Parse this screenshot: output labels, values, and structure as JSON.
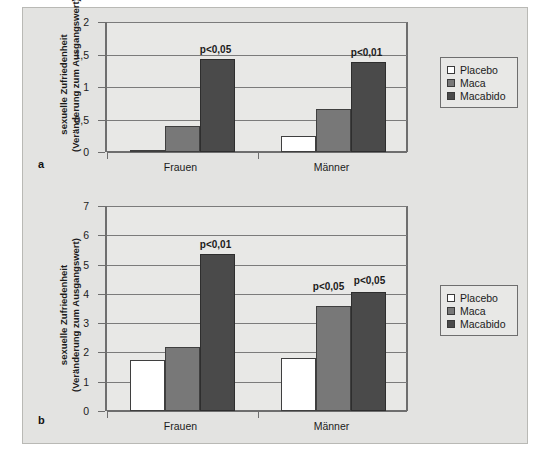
{
  "figure": {
    "background_color": "#e3e3e1",
    "panel_letters": {
      "top": "a",
      "bottom": "b"
    }
  },
  "legend": {
    "items": [
      {
        "label": "Placebo",
        "color": "#ffffff"
      },
      {
        "label": "Maca",
        "color": "#787878"
      },
      {
        "label": "Macabido",
        "color": "#4a4a4a"
      }
    ]
  },
  "axis_title": {
    "line1": "sexuelle Zufriedenheit",
    "line2": "(Veränderung zum Ausgangswert)"
  },
  "chart_data": [
    {
      "id": "a",
      "type": "bar",
      "title": "",
      "xlabel": "",
      "ylabel": "sexuelle Zufriedenheit (Veränderung zum Ausgangswert)",
      "categories": [
        "Frauen",
        "Männer"
      ],
      "ylim": [
        0,
        2
      ],
      "yticks": [
        "0",
        "0,5",
        "1",
        "1,5",
        "2"
      ],
      "ytick_values": [
        0,
        0.5,
        1,
        1.5,
        2
      ],
      "grid": true,
      "legend_position": "right",
      "series": [
        {
          "name": "Placebo",
          "color": "#ffffff",
          "values": [
            0.01,
            0.24
          ]
        },
        {
          "name": "Maca",
          "color": "#787878",
          "values": [
            0.4,
            0.66
          ]
        },
        {
          "name": "Macabido",
          "color": "#4a4a4a",
          "values": [
            1.43,
            1.39
          ]
        }
      ],
      "annotations": [
        {
          "text": "p<0,05",
          "category": "Frauen",
          "series": "Macabido"
        },
        {
          "text": "p<0,01",
          "category": "Männer",
          "series": "Macabido"
        }
      ]
    },
    {
      "id": "b",
      "type": "bar",
      "title": "",
      "xlabel": "",
      "ylabel": "sexuelle Zufriedenheit (Veränderung zum Ausgangswert)",
      "categories": [
        "Frauen",
        "Männer"
      ],
      "ylim": [
        0,
        7
      ],
      "yticks": [
        "0",
        "1",
        "2",
        "3",
        "4",
        "5",
        "6",
        "7"
      ],
      "ytick_values": [
        0,
        1,
        2,
        3,
        4,
        5,
        6,
        7
      ],
      "grid": true,
      "legend_position": "right",
      "series": [
        {
          "name": "Placebo",
          "color": "#ffffff",
          "values": [
            1.75,
            1.8
          ]
        },
        {
          "name": "Maca",
          "color": "#787878",
          "values": [
            2.2,
            3.6
          ]
        },
        {
          "name": "Macabido",
          "color": "#4a4a4a",
          "values": [
            5.35,
            4.05
          ]
        }
      ],
      "annotations": [
        {
          "text": "p<0,01",
          "category": "Frauen",
          "series": "Macabido"
        },
        {
          "text": "p<0,05",
          "category": "Männer",
          "series": "Maca"
        },
        {
          "text": "p<0,05",
          "category": "Männer",
          "series": "Macabido"
        }
      ]
    }
  ]
}
